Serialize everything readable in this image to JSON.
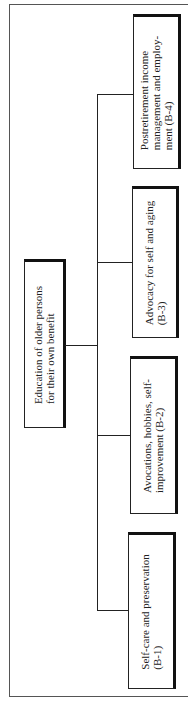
{
  "diagram": {
    "type": "tree",
    "orientation": "rotated-90",
    "root": {
      "id": "root",
      "lines": [
        "Education of older persons",
        "for their own benefit"
      ]
    },
    "children": [
      {
        "id": "B-1",
        "lines": [
          "Self-care and preservation",
          "(B-1)"
        ]
      },
      {
        "id": "B-2",
        "lines": [
          "Avocations, hobbies, self-",
          "improvement (B-2)"
        ]
      },
      {
        "id": "B-3",
        "lines": [
          "Advocacy for self and aging",
          "(B-3)"
        ]
      },
      {
        "id": "B-4",
        "lines": [
          "Postretirement income",
          "management and employ-",
          "ment (B-4)"
        ]
      }
    ]
  }
}
